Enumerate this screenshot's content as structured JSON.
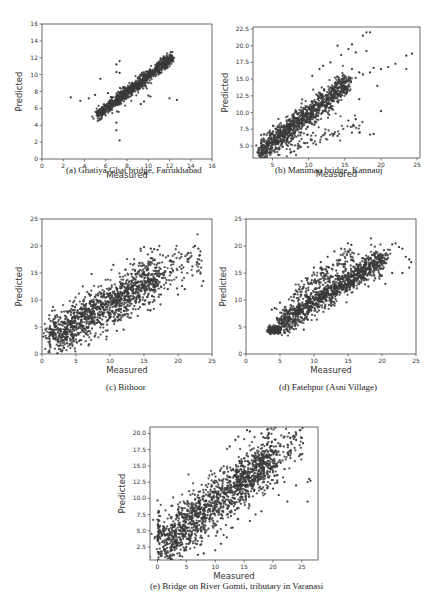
{
  "chart_data": [
    {
      "id": "a",
      "type": "scatter",
      "caption": "(a)   Ghatiya Ghat bridge, Farrukhabad",
      "xlabel": "Measured",
      "ylabel": "Predicted",
      "xlim": [
        0,
        16
      ],
      "ylim": [
        0,
        16
      ],
      "xticks": [
        0,
        2,
        4,
        6,
        8,
        10,
        12,
        14,
        16
      ],
      "yticks": [
        0,
        2,
        4,
        6,
        8,
        10,
        12,
        14,
        16
      ],
      "frame": {
        "left": 42,
        "top": 24,
        "right": 212,
        "bottom": 159
      },
      "caption_pos": {
        "x": 66,
        "y": 174
      },
      "point_color": "#3a3a3a",
      "clusters": [
        {
          "n": 900,
          "x_from": 5.2,
          "x_to": 12.3,
          "slope": 0.97,
          "intercept": 0.15,
          "noise": 0.35,
          "xnoise": 0.15
        },
        {
          "n": 40,
          "x_from": 6.5,
          "x_to": 10.0,
          "slope": 1.0,
          "intercept": -0.3,
          "noise": 0.7,
          "xnoise": 0.3
        }
      ],
      "outliers": [
        [
          2.7,
          7.3
        ],
        [
          3.6,
          6.9
        ],
        [
          4.4,
          7.2
        ],
        [
          5.5,
          9.5
        ],
        [
          5.0,
          7.6
        ],
        [
          7.0,
          11.2
        ],
        [
          7.3,
          11.6
        ],
        [
          7.0,
          10.3
        ],
        [
          7.3,
          10.2
        ],
        [
          7.0,
          4.3
        ],
        [
          7.0,
          3.4
        ],
        [
          7.3,
          2.2
        ],
        [
          7.2,
          5.6
        ],
        [
          9.6,
          6.8
        ],
        [
          10.0,
          7.5
        ],
        [
          10.2,
          7.4
        ],
        [
          12.0,
          7.2
        ],
        [
          12.7,
          7.0
        ],
        [
          9.3,
          6.5
        ],
        [
          6.2,
          7.8
        ]
      ]
    },
    {
      "id": "b",
      "type": "scatter",
      "caption": "(b) Manimau bridge, Kannauj",
      "xlabel": "Measured",
      "ylabel": "Predicted",
      "xlim": [
        2.3,
        25.4
      ],
      "ylim": [
        3.2,
        22.8
      ],
      "xticks": [
        5,
        10,
        15,
        20,
        25
      ],
      "yticks": [
        5.0,
        7.5,
        10.0,
        12.5,
        15.0,
        17.5,
        20.0,
        22.5
      ],
      "ytick_format": "fixed1",
      "frame": {
        "left": 253,
        "top": 27,
        "right": 420,
        "bottom": 158
      },
      "caption_pos": {
        "x": 275,
        "y": 174
      },
      "point_color": "#3a3a3a",
      "clusters": [
        {
          "n": 1100,
          "x_from": 3.2,
          "x_to": 15.5,
          "slope": 0.85,
          "intercept": 1.3,
          "noise": 0.9,
          "xnoise": 0.4
        },
        {
          "n": 60,
          "x_from": 7.5,
          "x_to": 17.5,
          "slope": 0.35,
          "intercept": 2.3,
          "noise": 0.6,
          "xnoise": 0.4
        }
      ],
      "outliers": [
        [
          17.5,
          21.5
        ],
        [
          18,
          22
        ],
        [
          18.5,
          22
        ],
        [
          14,
          20
        ],
        [
          16,
          20.2
        ],
        [
          14.5,
          18.6
        ],
        [
          15.5,
          19.5
        ],
        [
          16.5,
          19
        ],
        [
          18,
          19.2
        ],
        [
          12,
          17
        ],
        [
          13,
          17.5
        ],
        [
          11.5,
          16.5
        ],
        [
          10.5,
          15.5
        ],
        [
          16,
          16.5
        ],
        [
          17,
          16
        ],
        [
          19,
          16.7
        ],
        [
          20,
          16.5
        ],
        [
          21,
          16.8
        ],
        [
          22,
          17.3
        ],
        [
          23.5,
          18.5
        ],
        [
          24.3,
          18.8
        ],
        [
          23.5,
          16.5
        ],
        [
          19.5,
          14
        ],
        [
          20,
          10.2
        ],
        [
          17,
          12
        ],
        [
          16.5,
          15.2
        ],
        [
          17.5,
          15.7
        ],
        [
          18.5,
          16
        ],
        [
          19,
          6.8
        ],
        [
          18.5,
          6.7
        ],
        [
          17,
          7
        ],
        [
          16,
          7
        ],
        [
          15.5,
          8.8
        ],
        [
          16.5,
          9
        ],
        [
          14,
          6.5
        ],
        [
          10.3,
          6.0
        ],
        [
          9.5,
          5.4
        ],
        [
          8.5,
          4.6
        ],
        [
          7.5,
          4.0
        ],
        [
          8,
          4.2
        ]
      ]
    },
    {
      "id": "c",
      "type": "scatter",
      "caption": "(c) Bithoor",
      "xlabel": "Measured",
      "ylabel": "Predicted",
      "xlim": [
        0,
        25
      ],
      "ylim": [
        0,
        25
      ],
      "xticks": [
        0,
        5,
        10,
        15,
        20,
        25
      ],
      "yticks": [
        0,
        5,
        10,
        15,
        20,
        25
      ],
      "frame": {
        "left": 42,
        "top": 219,
        "right": 212,
        "bottom": 354
      },
      "caption_pos": {
        "x": 106,
        "y": 391
      },
      "point_color": "#3a3a3a",
      "clusters": [
        {
          "n": 1300,
          "x_from": 1.0,
          "x_to": 17.0,
          "slope": 0.72,
          "intercept": 2.0,
          "noise": 2.0,
          "xnoise": 0.8
        },
        {
          "n": 120,
          "x_from": 15.0,
          "x_to": 23.5,
          "slope": 0.3,
          "intercept": 10.5,
          "noise": 1.8,
          "xnoise": 0.5
        }
      ],
      "outliers": [
        [
          14.5,
          19.5
        ],
        [
          15,
          19.8
        ],
        [
          16,
          19.5
        ],
        [
          16.5,
          19.4
        ],
        [
          17,
          19.3
        ],
        [
          19.5,
          18.5
        ],
        [
          20.5,
          18.5
        ],
        [
          21.5,
          18.7
        ],
        [
          22.5,
          20
        ],
        [
          23,
          19.5
        ],
        [
          23.3,
          19
        ],
        [
          23.2,
          18.3
        ],
        [
          22.8,
          17
        ],
        [
          23.7,
          13.5
        ],
        [
          20,
          11
        ],
        [
          21,
          12
        ],
        [
          18.5,
          12
        ],
        [
          17.5,
          11
        ],
        [
          1.5,
          8
        ],
        [
          0.5,
          4.5
        ],
        [
          0.2,
          3.2
        ],
        [
          2.5,
          1.5
        ],
        [
          9.5,
          3.2
        ],
        [
          12,
          4.5
        ],
        [
          11,
          4.3
        ],
        [
          7.3,
          14.8
        ],
        [
          10.5,
          16.5
        ]
      ]
    },
    {
      "id": "d",
      "type": "scatter",
      "caption": "(d) Fatehpur (Asni Village)",
      "xlabel": "Measured",
      "ylabel": "Predicted",
      "xlim": [
        0,
        25
      ],
      "ylim": [
        0,
        25
      ],
      "xticks": [
        0,
        5,
        10,
        15,
        20,
        25
      ],
      "yticks": [
        0,
        5,
        10,
        15,
        20,
        25
      ],
      "frame": {
        "left": 246,
        "top": 219,
        "right": 416,
        "bottom": 354
      },
      "caption_pos": {
        "x": 279,
        "y": 391
      },
      "point_color": "#3a3a3a",
      "clusters": [
        {
          "n": 200,
          "x_from": 3.3,
          "x_to": 5.0,
          "slope": 0.1,
          "intercept": 4.0,
          "noise": 0.35,
          "xnoise": 0.2
        },
        {
          "n": 1200,
          "x_from": 5.0,
          "x_to": 20.5,
          "slope": 0.8,
          "intercept": 1.6,
          "noise": 1.1,
          "xnoise": 0.5
        },
        {
          "n": 150,
          "x_from": 7.0,
          "x_to": 16.0,
          "slope": 0.9,
          "intercept": 4.5,
          "noise": 0.9,
          "xnoise": 0.3
        }
      ],
      "outliers": [
        [
          15,
          20.5
        ],
        [
          15.5,
          20.2
        ],
        [
          14,
          19.5
        ],
        [
          13,
          19
        ],
        [
          12,
          18
        ],
        [
          11,
          17
        ],
        [
          10,
          16
        ],
        [
          21.5,
          20.3
        ],
        [
          22,
          20.5
        ],
        [
          22.5,
          19.8
        ],
        [
          23,
          19.5
        ],
        [
          23.5,
          18
        ],
        [
          24,
          17.5
        ],
        [
          24.3,
          17
        ],
        [
          24,
          16
        ],
        [
          23,
          15
        ],
        [
          21.5,
          15
        ],
        [
          20,
          14.5
        ],
        [
          19,
          14
        ],
        [
          20.5,
          13
        ],
        [
          18,
          12.5
        ],
        [
          3.8,
          8.2
        ],
        [
          4.2,
          8.5
        ],
        [
          5.0,
          9.5
        ],
        [
          8.5,
          4.5
        ],
        [
          7,
          4.6
        ],
        [
          6,
          4.6
        ]
      ]
    },
    {
      "id": "e",
      "type": "scatter",
      "caption": "(e)  Bridge on River Gomti, tributary in Varanasi",
      "xlabel": "Measured",
      "ylabel": "Predicted",
      "xlim": [
        -1.3,
        27.8
      ],
      "ylim": [
        0.5,
        21
      ],
      "xticks": [
        0,
        5,
        10,
        15,
        20,
        25
      ],
      "yticks": [
        2.5,
        5.0,
        7.5,
        10.0,
        12.5,
        15.0,
        17.5,
        20.0
      ],
      "ytick_format": "fixed1",
      "frame": {
        "left": 150,
        "top": 427,
        "right": 318,
        "bottom": 560
      },
      "caption_pos": {
        "x": 150,
        "y": 590
      },
      "point_color": "#3a3a3a",
      "clusters": [
        {
          "n": 1400,
          "x_from": 0.5,
          "x_to": 20.0,
          "slope": 0.7,
          "intercept": 2.3,
          "noise": 2.0,
          "xnoise": 0.8
        },
        {
          "n": 200,
          "x_from": 14.0,
          "x_to": 25.0,
          "slope": 0.55,
          "intercept": 5.0,
          "noise": 1.5,
          "xnoise": 0.5
        },
        {
          "n": 40,
          "x_from": 0.0,
          "x_to": 0.3,
          "slope": 0.0,
          "intercept": 4.5,
          "noise": 2.2,
          "xnoise": 0.1
        }
      ],
      "outliers": [
        [
          15.5,
          20.5
        ],
        [
          16,
          20.3
        ],
        [
          19,
          20.6
        ],
        [
          18,
          20
        ],
        [
          14,
          19.5
        ],
        [
          13.5,
          19
        ],
        [
          12.5,
          18
        ],
        [
          22,
          19.5
        ],
        [
          23,
          19.3
        ],
        [
          24,
          19
        ],
        [
          25,
          19.3
        ],
        [
          25.2,
          18.5
        ],
        [
          22,
          12.5
        ],
        [
          24,
          12
        ],
        [
          26,
          12.5
        ],
        [
          26.3,
          13
        ],
        [
          26.5,
          12.7
        ],
        [
          26,
          9.5
        ],
        [
          22.5,
          9.5
        ],
        [
          21,
          10.5
        ],
        [
          20,
          11.5
        ],
        [
          20.3,
          13.5
        ],
        [
          22,
          14.5
        ],
        [
          18,
          8
        ],
        [
          17,
          7.5
        ],
        [
          16,
          6.5
        ],
        [
          13,
          5.5
        ],
        [
          12,
          4
        ],
        [
          11,
          3
        ],
        [
          10,
          2
        ],
        [
          8,
          1.5
        ],
        [
          7,
          1.3
        ],
        [
          5,
          2.5
        ],
        [
          4,
          2.8
        ]
      ]
    }
  ]
}
